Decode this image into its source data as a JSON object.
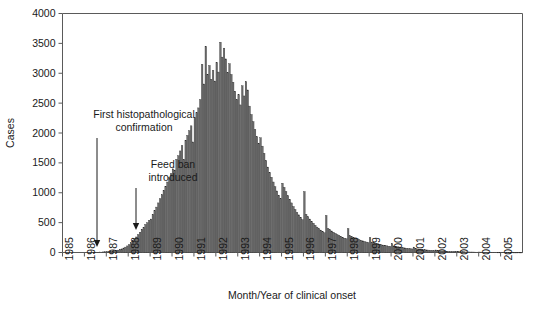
{
  "chart_data": {
    "type": "bar",
    "title": "",
    "xlabel": "Month/Year of clinical onset",
    "ylabel": "Cases",
    "ylim": [
      0,
      4000
    ],
    "ytick_step": 500,
    "yticks": [
      "0",
      "500",
      "1000",
      "1500",
      "2000",
      "2500",
      "3000",
      "3500",
      "4000"
    ],
    "ytick_values": [
      0,
      500,
      1000,
      1500,
      2000,
      2500,
      3000,
      3500,
      4000
    ],
    "xticks": [
      "1985",
      "1986",
      "1987",
      "1988",
      "1989",
      "1990",
      "1991",
      "1992",
      "1993",
      "1994",
      "1995",
      "1996",
      "1997",
      "1998",
      "1999",
      "2000",
      "2001",
      "2002",
      "2003",
      "2004",
      "2005"
    ],
    "xtick_values": [
      1985,
      1986,
      1987,
      1988,
      1989,
      1990,
      1991,
      1992,
      1993,
      1994,
      1995,
      1996,
      1997,
      1998,
      1999,
      2000,
      2001,
      2002,
      2003,
      2004,
      2005
    ],
    "x_unit": "month",
    "x_start": "1985-01",
    "x_end": "2005-12",
    "grid": false,
    "legend": false,
    "bar_color": "#6e6e6e",
    "bar_edge_color": "#2b2b2b",
    "axis_color": "#5a5a5a",
    "categories": [
      "1985-01",
      "1985-02",
      "1985-03",
      "1985-04",
      "1985-05",
      "1985-06",
      "1985-07",
      "1985-08",
      "1985-09",
      "1985-10",
      "1985-11",
      "1985-12",
      "1986-01",
      "1986-02",
      "1986-03",
      "1986-04",
      "1986-05",
      "1986-06",
      "1986-07",
      "1986-08",
      "1986-09",
      "1986-10",
      "1986-11",
      "1986-12",
      "1987-01",
      "1987-02",
      "1987-03",
      "1987-04",
      "1987-05",
      "1987-06",
      "1987-07",
      "1987-08",
      "1987-09",
      "1987-10",
      "1987-11",
      "1987-12",
      "1988-01",
      "1988-02",
      "1988-03",
      "1988-04",
      "1988-05",
      "1988-06",
      "1988-07",
      "1988-08",
      "1988-09",
      "1988-10",
      "1988-11",
      "1988-12",
      "1989-01",
      "1989-02",
      "1989-03",
      "1989-04",
      "1989-05",
      "1989-06",
      "1989-07",
      "1989-08",
      "1989-09",
      "1989-10",
      "1989-11",
      "1989-12",
      "1990-01",
      "1990-02",
      "1990-03",
      "1990-04",
      "1990-05",
      "1990-06",
      "1990-07",
      "1990-08",
      "1990-09",
      "1990-10",
      "1990-11",
      "1990-12",
      "1991-01",
      "1991-02",
      "1991-03",
      "1991-04",
      "1991-05",
      "1991-06",
      "1991-07",
      "1991-08",
      "1991-09",
      "1991-10",
      "1991-11",
      "1991-12",
      "1992-01",
      "1992-02",
      "1992-03",
      "1992-04",
      "1992-05",
      "1992-06",
      "1992-07",
      "1992-08",
      "1992-09",
      "1992-10",
      "1992-11",
      "1992-12",
      "1993-01",
      "1993-02",
      "1993-03",
      "1993-04",
      "1993-05",
      "1993-06",
      "1993-07",
      "1993-08",
      "1993-09",
      "1993-10",
      "1993-11",
      "1993-12",
      "1994-01",
      "1994-02",
      "1994-03",
      "1994-04",
      "1994-05",
      "1994-06",
      "1994-07",
      "1994-08",
      "1994-09",
      "1994-10",
      "1994-11",
      "1994-12",
      "1995-01",
      "1995-02",
      "1995-03",
      "1995-04",
      "1995-05",
      "1995-06",
      "1995-07",
      "1995-08",
      "1995-09",
      "1995-10",
      "1995-11",
      "1995-12",
      "1996-01",
      "1996-02",
      "1996-03",
      "1996-04",
      "1996-05",
      "1996-06",
      "1996-07",
      "1996-08",
      "1996-09",
      "1996-10",
      "1996-11",
      "1996-12",
      "1997-01",
      "1997-02",
      "1997-03",
      "1997-04",
      "1997-05",
      "1997-06",
      "1997-07",
      "1997-08",
      "1997-09",
      "1997-10",
      "1997-11",
      "1997-12",
      "1998-01",
      "1998-02",
      "1998-03",
      "1998-04",
      "1998-05",
      "1998-06",
      "1998-07",
      "1998-08",
      "1998-09",
      "1998-10",
      "1998-11",
      "1998-12",
      "1999-01",
      "1999-02",
      "1999-03",
      "1999-04",
      "1999-05",
      "1999-06",
      "1999-07",
      "1999-08",
      "1999-09",
      "1999-10",
      "1999-11",
      "1999-12",
      "2000-01",
      "2000-02",
      "2000-03",
      "2000-04",
      "2000-05",
      "2000-06",
      "2000-07",
      "2000-08",
      "2000-09",
      "2000-10",
      "2000-11",
      "2000-12",
      "2001-01",
      "2001-02",
      "2001-03",
      "2001-04",
      "2001-05",
      "2001-06",
      "2001-07",
      "2001-08",
      "2001-09",
      "2001-10",
      "2001-11",
      "2001-12",
      "2002-01",
      "2002-02",
      "2002-03",
      "2002-04",
      "2002-05",
      "2002-06",
      "2002-07",
      "2002-08",
      "2002-09",
      "2002-10",
      "2002-11",
      "2002-12",
      "2003-01",
      "2003-02",
      "2003-03",
      "2003-04",
      "2003-05",
      "2003-06",
      "2003-07",
      "2003-08",
      "2003-09",
      "2003-10",
      "2003-11",
      "2003-12",
      "2004-01",
      "2004-02",
      "2004-03",
      "2004-04",
      "2004-05",
      "2004-06",
      "2004-07",
      "2004-08",
      "2004-09",
      "2004-10",
      "2004-11",
      "2004-12",
      "2005-01",
      "2005-02",
      "2005-03",
      "2005-04",
      "2005-05",
      "2005-06",
      "2005-07",
      "2005-08",
      "2005-09",
      "2005-10",
      "2005-11",
      "2005-12"
    ],
    "values": [
      0,
      0,
      0,
      0,
      0,
      0,
      0,
      0,
      0,
      0,
      0,
      0,
      0,
      0,
      0,
      0,
      3,
      2,
      5,
      4,
      8,
      6,
      10,
      12,
      14,
      18,
      22,
      20,
      30,
      35,
      40,
      55,
      60,
      75,
      90,
      110,
      130,
      165,
      200,
      230,
      260,
      300,
      340,
      390,
      420,
      470,
      500,
      540,
      560,
      640,
      700,
      760,
      830,
      900,
      970,
      1040,
      1110,
      1180,
      1250,
      1320,
      1400,
      1380,
      1560,
      1620,
      1700,
      1790,
      1560,
      1880,
      1960,
      2040,
      2120,
      1850,
      2260,
      2340,
      2420,
      2560,
      3150,
      2820,
      3450,
      2980,
      3130,
      2900,
      3050,
      2870,
      3180,
      3020,
      3520,
      3270,
      3420,
      3240,
      3010,
      3160,
      2980,
      2850,
      2700,
      2560,
      2640,
      2470,
      2790,
      2620,
      2860,
      2720,
      2450,
      2310,
      2190,
      2060,
      1940,
      1830,
      1920,
      1780,
      1660,
      1540,
      1430,
      1340,
      1260,
      1180,
      1100,
      1030,
      960,
      900,
      1160,
      1090,
      1020,
      950,
      890,
      830,
      770,
      720,
      670,
      630,
      590,
      550,
      1020,
      640,
      600,
      560,
      520,
      490,
      455,
      425,
      400,
      375,
      350,
      330,
      620,
      400,
      380,
      360,
      340,
      320,
      300,
      285,
      270,
      255,
      240,
      230,
      400,
      280,
      265,
      250,
      240,
      230,
      215,
      205,
      195,
      185,
      175,
      165,
      250,
      175,
      165,
      155,
      148,
      140,
      132,
      125,
      118,
      112,
      105,
      100,
      150,
      110,
      104,
      98,
      92,
      87,
      82,
      77,
      72,
      68,
      64,
      60,
      90,
      64,
      60,
      56,
      52,
      49,
      46,
      43,
      40,
      37,
      34,
      32,
      42,
      30,
      28,
      26,
      24,
      22,
      20,
      19,
      17,
      16,
      15,
      14,
      18,
      14,
      13,
      12,
      11,
      10,
      9,
      8,
      8,
      7,
      6,
      6,
      8,
      6,
      5,
      5,
      4,
      4,
      4,
      3,
      3,
      3,
      2,
      2,
      4,
      3,
      3,
      2,
      2,
      2,
      2,
      1,
      1,
      1,
      1,
      1
    ],
    "peak_value": 3520,
    "peak_category": "1992-03",
    "annotations": [
      {
        "id": "first-histopathological-confirmation",
        "line1": "First histopathological",
        "line2": "confirmation",
        "x_category": "1986-11",
        "label_x": 144,
        "label_y1": 118,
        "label_y2": 131,
        "arrow_x": 97,
        "arrow_y_top": 138,
        "arrow_y_bottom": 247
      },
      {
        "id": "feed-ban-introduced",
        "line1": "Feed ban",
        "line2": "introduced",
        "x_category": "1988-07",
        "label_x": 173,
        "label_y1": 168,
        "label_y2": 181,
        "arrow_x": 136,
        "arrow_y_top": 188,
        "arrow_y_bottom": 230
      }
    ]
  }
}
